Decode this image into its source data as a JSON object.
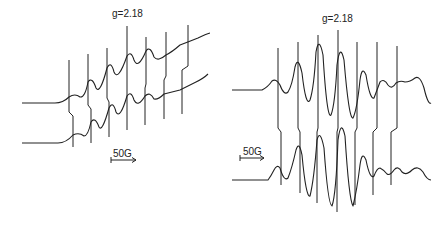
{
  "chart_data": [
    {
      "type": "line",
      "title": "g=2.18",
      "panel": "left",
      "scale_bar": "50G",
      "series": [
        {
          "name": "upper spectrum",
          "path": "M22,103 L55,103 Q63,103 69,97 Q75,93 80,97 Q85,98 88,82 Q92,76 96,88 Q100,95 107,68 Q111,60 114,72 Q118,82 127,56 Q131,50 134,60 Q138,70 146,51 Q150,45 154,57 Q158,62 166,55 Q172,52 180,45 Q188,42 198,38 Q206,34 210,33"
        },
        {
          "name": "lower spectrum",
          "path": "M22,143 L58,143 Q66,143 73,135 Q79,132 84,136 Q88,136 91,122 Q95,116 99,127 Q102,133 109,108 Q113,100 116,112 Q120,120 127,96 Q131,90 134,100 Q138,108 145,96 Q150,91 154,99 Q158,100 164,94 Q172,92 180,90 Q188,86 196,82 Q204,78 208,74"
        }
      ],
      "sticks": {
        "top_x": [
          69,
          88,
          107,
          127,
          146,
          166,
          188
        ],
        "bottom_x": [
          73,
          91,
          109,
          127,
          145,
          164,
          182
        ],
        "top_y": [
          60,
          54,
          48,
          26,
          37,
          32,
          25
        ],
        "bottom_y": [
          147,
          143,
          137,
          130,
          125,
          119,
          114
        ],
        "step_y": [
          112,
          105,
          98,
          84,
          84,
          76,
          66
        ]
      }
    },
    {
      "type": "line",
      "title": "g=2.18",
      "panel": "right",
      "scale_bar": "50G",
      "series": [
        {
          "name": "upper spectrum",
          "path": "M232,90 L262,90 Q268,87 272,81 Q276,78 280,85 Q284,96 288,92 Q292,86 295,67 Q298,55 302,73 Q306,108 310,100 Q314,88 316,52 Q319,35 323,55 Q327,120 331,115 Q335,105 337,65 Q340,42 344,60 Q349,120 353,118 Q357,110 360,80 Q362,65 366,75 Q370,100 374,98 Q377,90 380,82 Q384,78 388,85 Q392,90 396,83 Q400,80 405,82 Q410,82 415,78 Q420,75 424,88 Q428,105 431,103"
        },
        {
          "name": "lower spectrum",
          "path": "M232,180 L268,180 Q271,176 274,170 Q277,164 280,168 Q284,182 288,178 Q292,168 296,150 Q299,140 302,155 Q306,198 310,196 Q314,180 317,140 Q320,128 324,148 Q328,205 332,206 Q336,195 338,140 Q341,118 345,136 Q349,200 353,206 Q357,190 360,165 Q362,150 366,160 Q370,180 374,176 Q377,168 380,168 Q384,170 387,174 Q390,176 394,170 Q398,165 402,172 Q406,176 412,170 Q418,165 423,172 Q427,180 431,180"
        }
      ],
      "sticks": {
        "top_x": [
          278,
          298,
          318,
          338,
          357,
          377,
          397
        ],
        "bottom_x": [
          281,
          300,
          317,
          337,
          355,
          373,
          391
        ],
        "top_y": [
          48,
          42,
          35,
          30,
          42,
          42,
          46
        ],
        "bottom_y": [
          185,
          193,
          203,
          212,
          205,
          195,
          185
        ],
        "step_y": [
          128,
          128,
          128,
          128,
          128,
          128,
          128
        ]
      }
    }
  ],
  "labels": {
    "left_title": "g=2.18",
    "right_title": "g=2.18",
    "left_scale": "50G",
    "right_scale": "50G"
  }
}
